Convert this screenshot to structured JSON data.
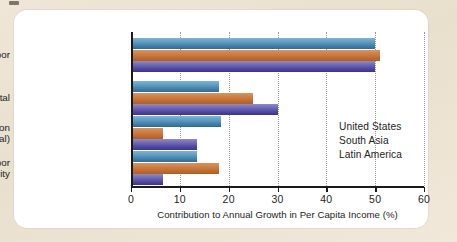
{
  "chart_data": {
    "type": "bar",
    "orientation": "horizontal",
    "title": "",
    "xlabel": "Contribution to Annual Growth in Per Capita Income (%)",
    "ylabel": "",
    "xlim": [
      0,
      60
    ],
    "xticks": [
      0,
      10,
      20,
      30,
      40,
      50,
      60
    ],
    "xtick_labels": [
      "0",
      "10",
      "20",
      "30",
      "40",
      "50",
      "60"
    ],
    "grid": "vertical-dotted",
    "legend_position": "inside-right",
    "categories": [
      "Labor",
      "Physical capital",
      "Education\n(human capital)",
      "Capital and labor\nproductivity"
    ],
    "category_lines": [
      [
        "Labor"
      ],
      [
        "Physical capital"
      ],
      [
        "Education",
        "(human capital)"
      ],
      [
        "Capital and labor",
        "productivity"
      ]
    ],
    "series": [
      {
        "name": "United States",
        "color": "#3d7fa8",
        "values": [
          50,
          18,
          18.5,
          13.5
        ]
      },
      {
        "name": "South Asia",
        "color": "#bf6a2c",
        "values": [
          51,
          25,
          6.5,
          18
        ]
      },
      {
        "name": "Latin America",
        "color": "#4a41a0",
        "values": [
          50,
          30,
          13.5,
          6.5
        ]
      }
    ]
  },
  "legend": {
    "items": [
      {
        "label": "United States"
      },
      {
        "label": "South Asia"
      },
      {
        "label": "Latin America"
      }
    ]
  }
}
